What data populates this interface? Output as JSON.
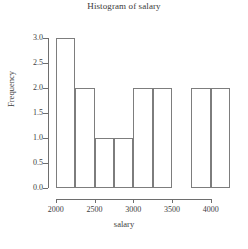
{
  "chart_data": {
    "type": "bar",
    "title": "Histogram of salary",
    "xlabel": "salary",
    "ylabel": "Frequency",
    "grid": false,
    "legend": null,
    "xlim": [
      1950,
      4300
    ],
    "ylim": [
      0,
      3.15
    ],
    "bin_width": 250,
    "bin_edges": [
      2000,
      2250,
      2500,
      2750,
      3000,
      3250,
      3500,
      3750,
      4000,
      4250
    ],
    "categories": [
      "2000-2250",
      "2250-2500",
      "2500-2750",
      "2750-3000",
      "3000-3250",
      "3250-3500",
      "3500-3750",
      "3750-4000",
      "4000-4250"
    ],
    "values": [
      3,
      2,
      1,
      1,
      2,
      2,
      0,
      2,
      2
    ],
    "xticks": [
      2000,
      2500,
      3000,
      3500,
      4000
    ],
    "xtick_labels": [
      "2000",
      "2500",
      "3000",
      "3500",
      "4000"
    ],
    "yticks": [
      0.0,
      0.5,
      1.0,
      1.5,
      2.0,
      2.5,
      3.0
    ],
    "ytick_labels": [
      "0.0",
      "0.5",
      "1.0",
      "1.5",
      "2.0",
      "2.5",
      "3.0"
    ],
    "bar_fill": "#ffffff",
    "bar_border": "#7d7d7d",
    "axis_color": "#6e6e6e",
    "text_color": "#3d3d3d"
  }
}
